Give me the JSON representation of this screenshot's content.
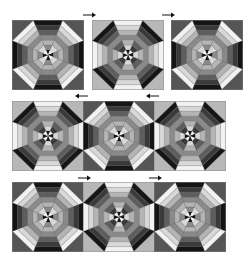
{
  "diagram": {
    "title": "",
    "palette": {
      "black": "#151515",
      "dark": "#3a3a3a",
      "mid_dark": "#5e5e5e",
      "mid": "#8a8a8a",
      "mid_light": "#b4b4b4",
      "light": "#d8d8d8",
      "white": "#f2f2f2",
      "bg_dark": "#555555",
      "bg_light": "#b8b8b8",
      "outline": "#888888",
      "arrow": "#111111"
    },
    "variants": {
      "A": {
        "background": "bg_dark",
        "wedge_stripes": {
          "axis": [
            "black",
            "dark",
            "mid_dark",
            "mid",
            "mid_light",
            "mid",
            "dark"
          ],
          "diagonal": [
            "white",
            "light",
            "mid_light",
            "mid",
            "mid_light",
            "light",
            "white"
          ]
        }
      },
      "B": {
        "background": "bg_light",
        "wedge_stripes": {
          "axis": [
            "white",
            "light",
            "mid_light",
            "mid",
            "mid_light",
            "light",
            "mid_dark"
          ],
          "diagonal": [
            "black",
            "dark",
            "mid_dark",
            "mid",
            "mid_dark",
            "dark",
            "black"
          ]
        }
      }
    },
    "rows": [
      {
        "blocks": [
          "A",
          "B",
          "A"
        ],
        "arrows": [
          "right",
          "right"
        ],
        "joined": false
      },
      {
        "blocks": [
          "B",
          "A",
          "B"
        ],
        "arrows": [
          "left",
          "left"
        ],
        "joined": true
      },
      {
        "blocks": [
          "A",
          "B",
          "A"
        ],
        "arrows": [
          "right",
          "right"
        ],
        "joined": true
      }
    ]
  }
}
